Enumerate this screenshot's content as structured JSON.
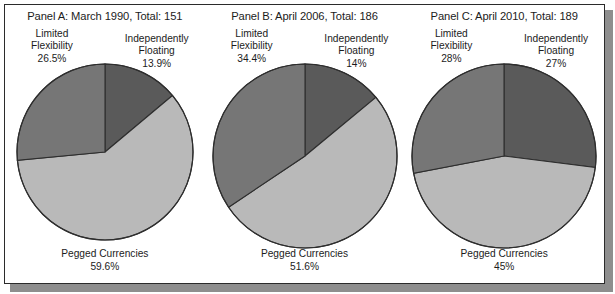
{
  "figure": {
    "background": "#ffffff",
    "frame_color": "#2b2b2b",
    "shadow_color": "#8e8e8e"
  },
  "colors": {
    "independently_floating": "#5a5a5a",
    "limited_flexibility": "#767676",
    "pegged_currencies": "#b9b9b9",
    "slice_outline": "#2e2e2e",
    "text": "#1c1c1c"
  },
  "panels": [
    {
      "title": "Panel A: March 1990, Total: 151",
      "label_left": "Limited\nFlexibility\n26.5%",
      "label_left_name": "Limited Flexibility",
      "label_left_value": "26.5%",
      "label_right": "Independently\nFloating\n13.9%",
      "label_right_name": "Independently Floating",
      "label_right_value": "13.9%",
      "label_bottom": "Pegged Currencies\n59.6%",
      "label_bottom_name": "Pegged Currencies",
      "label_bottom_value": "59.6%",
      "radius": 88
    },
    {
      "title": "Panel B: April 2006, Total: 186",
      "label_left": "Limited\nFlexibility\n34.4%",
      "label_left_name": "Limited Flexibility",
      "label_left_value": "34.4%",
      "label_right": "Independently\nFloating\n14%",
      "label_right_name": "Independently Floating",
      "label_right_value": "14%",
      "label_bottom": "Pegged Currencies\n51.6%",
      "label_bottom_name": "Pegged Currencies",
      "label_bottom_value": "51.6%",
      "radius": 92
    },
    {
      "title": "Panel C: April 2010, Total: 189",
      "label_left": "Limited\nFlexibility\n28%",
      "label_left_name": "Limited Flexibility",
      "label_left_value": "28%",
      "label_right": "Independently\nFloating\n27%",
      "label_right_name": "Independently Floating",
      "label_right_value": "27%",
      "label_bottom": "Pegged Currencies\n45%",
      "label_bottom_name": "Pegged Currencies",
      "label_bottom_value": "45%",
      "radius": 92
    }
  ],
  "chart_data": [
    {
      "type": "pie",
      "title": "Panel A: March 1990, Total: 151",
      "total": 151,
      "start_angle_deg": 0,
      "direction": "clockwise",
      "labels": [
        "Independently Floating",
        "Pegged Currencies",
        "Limited Flexibility"
      ],
      "values": [
        13.9,
        59.6,
        26.5
      ],
      "value_suffix": "%",
      "colors": [
        "#5a5a5a",
        "#b9b9b9",
        "#767676"
      ],
      "legend": "none"
    },
    {
      "type": "pie",
      "title": "Panel B: April 2006, Total: 186",
      "total": 186,
      "start_angle_deg": 0,
      "direction": "clockwise",
      "labels": [
        "Independently Floating",
        "Pegged Currencies",
        "Limited Flexibility"
      ],
      "values": [
        14,
        51.6,
        34.4
      ],
      "value_suffix": "%",
      "colors": [
        "#5a5a5a",
        "#b9b9b9",
        "#767676"
      ],
      "legend": "none"
    },
    {
      "type": "pie",
      "title": "Panel C: April 2010, Total: 189",
      "total": 189,
      "start_angle_deg": 0,
      "direction": "clockwise",
      "labels": [
        "Independently Floating",
        "Pegged Currencies",
        "Limited Flexibility"
      ],
      "values": [
        27,
        45,
        28
      ],
      "value_suffix": "%",
      "colors": [
        "#5a5a5a",
        "#b9b9b9",
        "#767676"
      ],
      "legend": "none"
    }
  ]
}
